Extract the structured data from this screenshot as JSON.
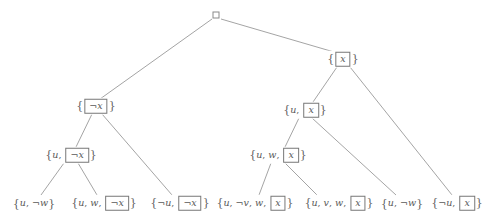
{
  "diagram": {
    "edge_color": "#8d8d8d",
    "node_text_color": "#5a5a5a",
    "box_border_color": "#777777",
    "background": "#ffffff",
    "root": {
      "id": "root",
      "label": "",
      "symbol": "empty-clause-box",
      "x": 216,
      "y": 15
    },
    "nodes": [
      {
        "id": "n-x",
        "text": "{ x }",
        "parts": [
          {
            "t": "brace",
            "v": "{"
          },
          {
            "t": "boxed",
            "v": "x"
          },
          {
            "t": "brace",
            "v": "}"
          }
        ],
        "x": 343,
        "y": 59
      },
      {
        "id": "n-notx",
        "text": "{ ¬x }",
        "parts": [
          {
            "t": "brace",
            "v": "{"
          },
          {
            "t": "boxed",
            "v": "¬x"
          },
          {
            "t": "brace",
            "v": "}"
          }
        ],
        "x": 96,
        "y": 106
      },
      {
        "id": "n-u-x",
        "text": "{u, x }",
        "parts": [
          {
            "t": "brace",
            "v": "{"
          },
          {
            "t": "lit",
            "v": "u"
          },
          {
            "t": "comma",
            "v": ", "
          },
          {
            "t": "boxed",
            "v": "x"
          },
          {
            "t": "brace",
            "v": "}"
          }
        ],
        "x": 305,
        "y": 110
      },
      {
        "id": "n-u-notx",
        "text": "{u, ¬x }",
        "parts": [
          {
            "t": "brace",
            "v": "{"
          },
          {
            "t": "lit",
            "v": "u"
          },
          {
            "t": "comma",
            "v": ", "
          },
          {
            "t": "boxed",
            "v": "¬x"
          },
          {
            "t": "brace",
            "v": "}"
          }
        ],
        "x": 71,
        "y": 155
      },
      {
        "id": "n-u-w-x",
        "text": "{u, w, x }",
        "parts": [
          {
            "t": "brace",
            "v": "{"
          },
          {
            "t": "lit",
            "v": "u"
          },
          {
            "t": "comma",
            "v": ", "
          },
          {
            "t": "lit",
            "v": "w"
          },
          {
            "t": "comma",
            "v": ", "
          },
          {
            "t": "boxed",
            "v": "x"
          },
          {
            "t": "brace",
            "v": "}"
          }
        ],
        "x": 278,
        "y": 155
      }
    ],
    "leaves": [
      {
        "id": "l-u-notw-1",
        "text": "{u, ¬w}",
        "parts": [
          {
            "t": "brace",
            "v": "{"
          },
          {
            "t": "lit",
            "v": "u"
          },
          {
            "t": "comma",
            "v": ", "
          },
          {
            "t": "neg",
            "v": "¬"
          },
          {
            "t": "lit",
            "v": "w"
          },
          {
            "t": "brace",
            "v": "}"
          }
        ],
        "x": 34,
        "y": 203
      },
      {
        "id": "l-u-w-notx",
        "text": "{u, w, ¬x }",
        "parts": [
          {
            "t": "brace",
            "v": "{"
          },
          {
            "t": "lit",
            "v": "u"
          },
          {
            "t": "comma",
            "v": ", "
          },
          {
            "t": "lit",
            "v": "w"
          },
          {
            "t": "comma",
            "v": ", "
          },
          {
            "t": "boxed",
            "v": "¬x"
          },
          {
            "t": "brace",
            "v": "}"
          }
        ],
        "x": 104,
        "y": 203
      },
      {
        "id": "l-notu-notx",
        "text": "{¬u, ¬x }",
        "parts": [
          {
            "t": "brace",
            "v": "{"
          },
          {
            "t": "neg",
            "v": "¬"
          },
          {
            "t": "lit",
            "v": "u"
          },
          {
            "t": "comma",
            "v": ", "
          },
          {
            "t": "boxed",
            "v": "¬x"
          },
          {
            "t": "brace",
            "v": "}"
          }
        ],
        "x": 180,
        "y": 203
      },
      {
        "id": "l-u-notv-w-x",
        "text": "{u, ¬v, w, x }",
        "parts": [
          {
            "t": "brace",
            "v": "{"
          },
          {
            "t": "lit",
            "v": "u"
          },
          {
            "t": "comma",
            "v": ", "
          },
          {
            "t": "neg",
            "v": "¬"
          },
          {
            "t": "lit",
            "v": "v"
          },
          {
            "t": "comma",
            "v": ", "
          },
          {
            "t": "lit",
            "v": "w"
          },
          {
            "t": "comma",
            "v": ", "
          },
          {
            "t": "boxed",
            "v": "x"
          },
          {
            "t": "brace",
            "v": "}"
          }
        ],
        "x": 255,
        "y": 203
      },
      {
        "id": "l-u-v-w-x",
        "text": "{u, v, w, x }",
        "parts": [
          {
            "t": "brace",
            "v": "{"
          },
          {
            "t": "lit",
            "v": "u"
          },
          {
            "t": "comma",
            "v": ", "
          },
          {
            "t": "lit",
            "v": "v"
          },
          {
            "t": "comma",
            "v": ", "
          },
          {
            "t": "lit",
            "v": "w"
          },
          {
            "t": "comma",
            "v": ", "
          },
          {
            "t": "boxed",
            "v": "x"
          },
          {
            "t": "brace",
            "v": "}"
          }
        ],
        "x": 339,
        "y": 203
      },
      {
        "id": "l-u-notw-2",
        "text": "{u, ¬w}",
        "parts": [
          {
            "t": "brace",
            "v": "{"
          },
          {
            "t": "lit",
            "v": "u"
          },
          {
            "t": "comma",
            "v": ", "
          },
          {
            "t": "neg",
            "v": "¬"
          },
          {
            "t": "lit",
            "v": "w"
          },
          {
            "t": "brace",
            "v": "}"
          }
        ],
        "x": 402,
        "y": 203
      },
      {
        "id": "l-notu-x",
        "text": "{¬u, x }",
        "parts": [
          {
            "t": "brace",
            "v": "{"
          },
          {
            "t": "neg",
            "v": "¬"
          },
          {
            "t": "lit",
            "v": "u"
          },
          {
            "t": "comma",
            "v": ", "
          },
          {
            "t": "boxed",
            "v": "x"
          },
          {
            "t": "brace",
            "v": "}"
          }
        ],
        "x": 457,
        "y": 203
      }
    ],
    "edges": [
      {
        "from": "root",
        "to": "n-notx",
        "x1": 212,
        "y1": 19,
        "x2": 100,
        "y2": 99
      },
      {
        "from": "root",
        "to": "n-x",
        "x1": 221,
        "y1": 19,
        "x2": 334,
        "y2": 52
      },
      {
        "from": "n-notx",
        "to": "n-u-notx",
        "x1": 92,
        "y1": 114,
        "x2": 76,
        "y2": 147
      },
      {
        "from": "n-notx",
        "to": "l-notu-notx",
        "x1": 102,
        "y1": 114,
        "x2": 172,
        "y2": 195
      },
      {
        "from": "n-u-notx",
        "to": "l-u-notw-1",
        "x1": 64,
        "y1": 163,
        "x2": 41,
        "y2": 195
      },
      {
        "from": "n-u-notx",
        "to": "l-u-w-notx",
        "x1": 78,
        "y1": 163,
        "x2": 97,
        "y2": 195
      },
      {
        "from": "n-x",
        "to": "n-u-x",
        "x1": 337,
        "y1": 67,
        "x2": 313,
        "y2": 102
      },
      {
        "from": "n-x",
        "to": "l-notu-x",
        "x1": 350,
        "y1": 67,
        "x2": 452,
        "y2": 195
      },
      {
        "from": "n-u-x",
        "to": "n-u-w-x",
        "x1": 299,
        "y1": 118,
        "x2": 285,
        "y2": 147
      },
      {
        "from": "n-u-x",
        "to": "l-u-notw-2",
        "x1": 312,
        "y1": 118,
        "x2": 396,
        "y2": 195
      },
      {
        "from": "n-u-w-x",
        "to": "l-u-notv-w-x",
        "x1": 271,
        "y1": 163,
        "x2": 259,
        "y2": 195
      },
      {
        "from": "n-u-w-x",
        "to": "l-u-v-w-x",
        "x1": 285,
        "y1": 163,
        "x2": 317,
        "y2": 195
      }
    ]
  }
}
